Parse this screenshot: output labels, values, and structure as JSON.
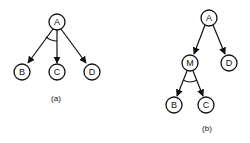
{
  "diagrams": {
    "a": {
      "caption": "(a)",
      "nodes": {
        "A": "A",
        "B": "B",
        "C": "C",
        "D": "D"
      },
      "edges": [
        [
          "A",
          "B"
        ],
        [
          "A",
          "C"
        ],
        [
          "A",
          "D"
        ]
      ],
      "and_arc": [
        "A-B",
        "A-C"
      ]
    },
    "b": {
      "caption": "(b)",
      "nodes": {
        "A": "A",
        "M": "M",
        "D": "D",
        "B": "B",
        "C": "C"
      },
      "edges": [
        [
          "A",
          "M"
        ],
        [
          "A",
          "D"
        ],
        [
          "M",
          "B"
        ],
        [
          "M",
          "C"
        ]
      ],
      "and_arc": [
        "M-B",
        "M-C"
      ]
    }
  },
  "colors": {
    "line": "#111111",
    "background": "#ffffff"
  }
}
